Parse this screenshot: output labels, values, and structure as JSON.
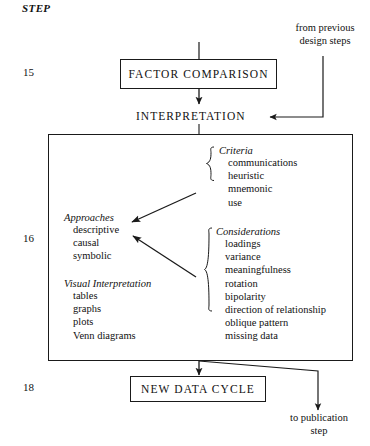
{
  "diagram": {
    "header_label": "STEP",
    "steps": [
      {
        "number": "15"
      },
      {
        "number": "16"
      },
      {
        "number": "18"
      }
    ],
    "nodes": {
      "factor_comparison": "FACTOR COMPARISON",
      "interpretation": "INTERPRETATION",
      "new_data_cycle": "NEW DATA CYCLE"
    },
    "annotations": {
      "from_previous_line1": "from previous",
      "from_previous_line2": "design steps",
      "to_publication_line1": "to publication",
      "to_publication_line2": "step"
    },
    "groups": [
      {
        "key": "criteria",
        "title": "Criteria",
        "items": [
          "communications",
          "heuristic",
          "mnemonic",
          "use"
        ]
      },
      {
        "key": "approaches",
        "title": "Approaches",
        "items": [
          "descriptive",
          "causal",
          "symbolic"
        ]
      },
      {
        "key": "visual_interpretation",
        "title": "Visual Interpretation",
        "items": [
          "tables",
          "graphs",
          "plots",
          "Venn diagrams"
        ]
      },
      {
        "key": "considerations",
        "title": "Considerations",
        "items": [
          "loadings",
          "variance",
          "meaningfulness",
          "rotation",
          "bipolarity",
          "direction of relationship",
          "oblique pattern",
          "missing data"
        ]
      }
    ],
    "colors": {
      "ink": "#1a1a1a",
      "paper": "#ffffff"
    }
  }
}
